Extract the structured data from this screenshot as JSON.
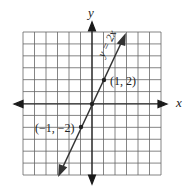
{
  "chart_data": {
    "type": "line",
    "title": "",
    "xlabel": "x",
    "ylabel": "y",
    "xlim": [
      -6,
      6
    ],
    "ylim": [
      -6,
      6
    ],
    "grid": true,
    "series": [
      {
        "name": "y = 2x",
        "equation": "y = 2x",
        "x": [
          -3,
          -1,
          0,
          1,
          3
        ],
        "y": [
          -6,
          -2,
          0,
          2,
          6
        ]
      }
    ],
    "points": [
      {
        "x": -1,
        "y": -2,
        "label": "(−1, −2)"
      },
      {
        "x": 0,
        "y": 0,
        "label": ""
      },
      {
        "x": 1,
        "y": 2,
        "label": "(1, 2)"
      }
    ]
  },
  "labels": {
    "x_axis": "x",
    "y_axis": "y",
    "equation": "y = 2x",
    "point_pos": "(1, 2)",
    "point_neg": "(−1, −2)"
  },
  "colors": {
    "grid": "#555555",
    "axis": "#1a1a1a",
    "line": "#333333"
  }
}
